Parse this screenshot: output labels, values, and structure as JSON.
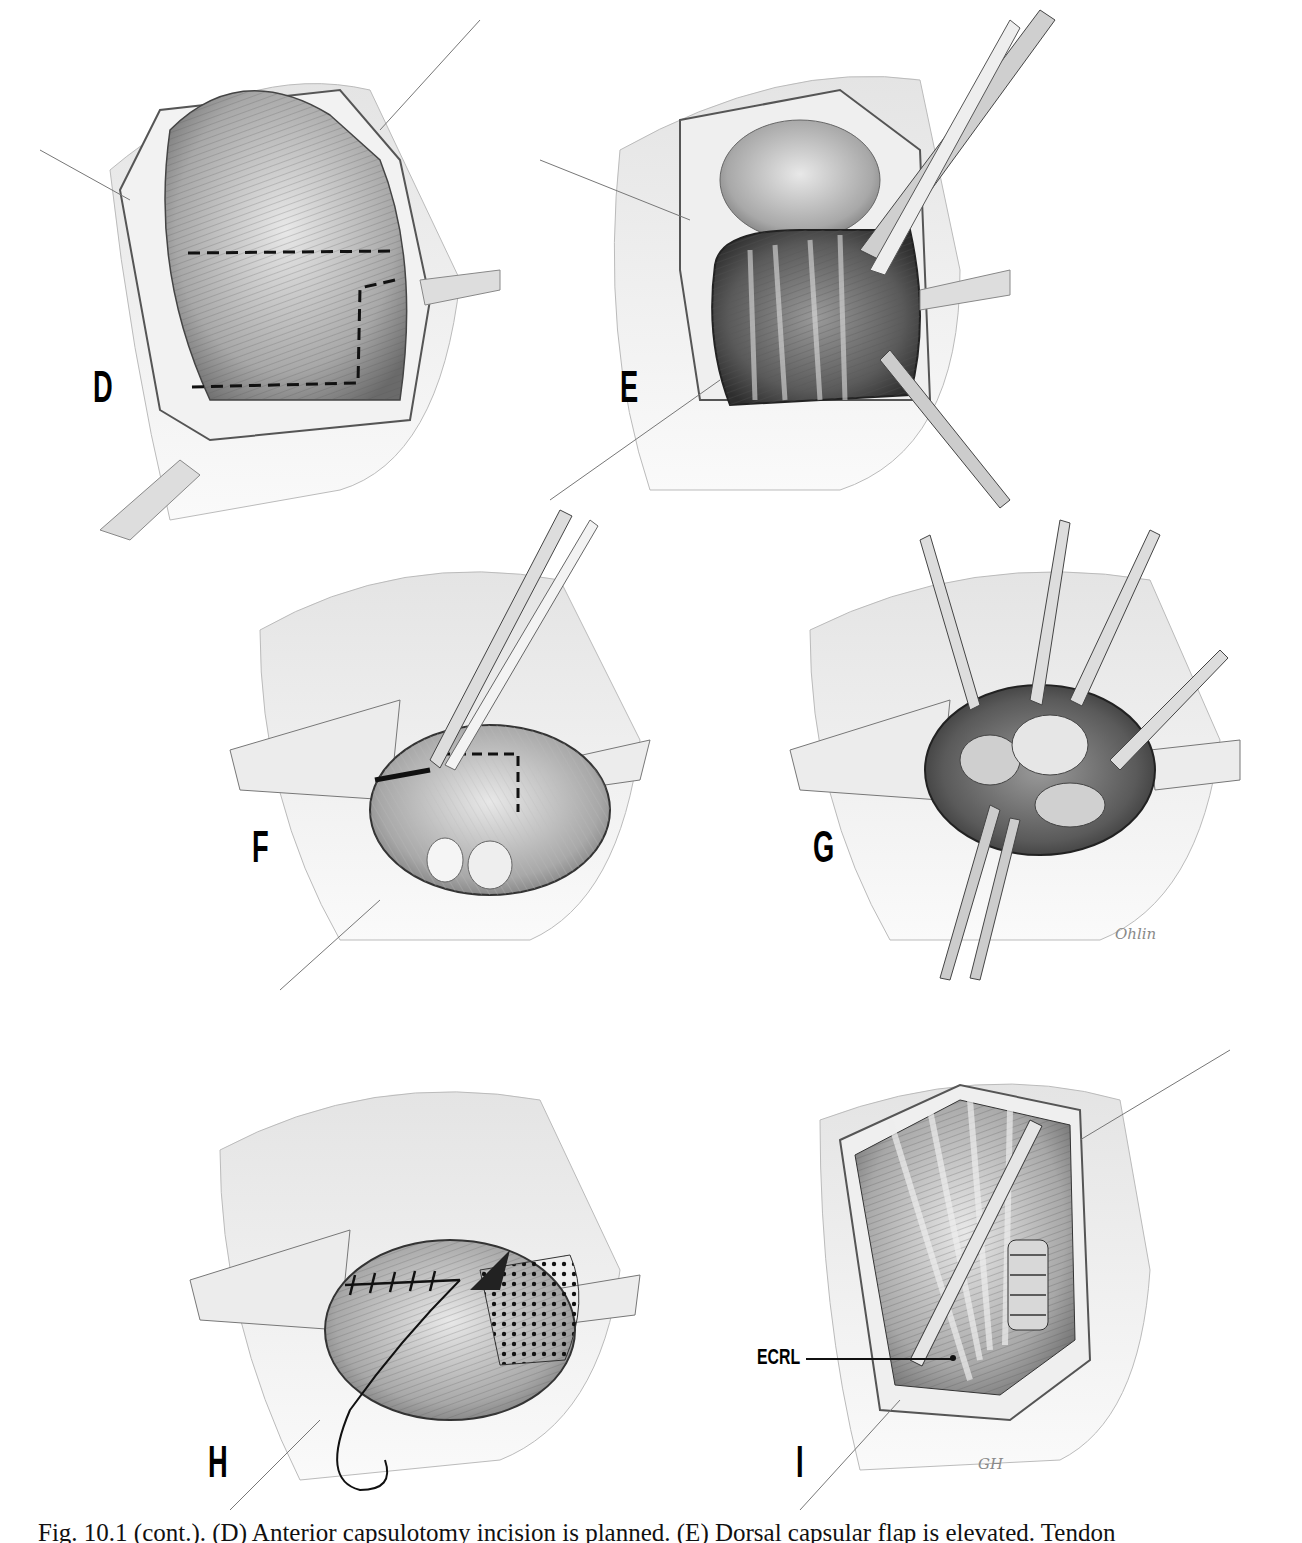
{
  "figure": {
    "panels": [
      {
        "id": "D",
        "label": "D",
        "description": "Anterior capsule exposed with dashed incision outline planned"
      },
      {
        "id": "E",
        "label": "E",
        "description": "Capsule incised and flap elevated with forceps; tendons exposed"
      },
      {
        "id": "F",
        "label": "F",
        "description": "Capsular incision performed along dashed line with scalpel"
      },
      {
        "id": "G",
        "label": "G",
        "description": "Capsule retracted with multiple instruments exposing joint"
      },
      {
        "id": "H",
        "label": "H",
        "description": "Capsule repaired with sutures; dotted mesh region and curved needle"
      },
      {
        "id": "I",
        "label": "I",
        "description": "Completed repair with tendon transfer annotated"
      }
    ],
    "annotations": [
      {
        "panel": "I",
        "text": "ECRL"
      }
    ],
    "signatures": [
      {
        "panel": "G",
        "text": "Ohlin"
      },
      {
        "panel": "I",
        "text": "GH"
      }
    ],
    "caption": "Fig. 10.1 (cont.). (D) Anterior capsulotomy incision is planned. (E) Dorsal capsular flap is elevated. Tendon"
  },
  "colors": {
    "ink": "#111111",
    "pencil_dark": "#3a3a3a",
    "pencil_mid": "#8c8c8c",
    "pencil_light": "#cfcfcf",
    "paper": "#ffffff"
  }
}
